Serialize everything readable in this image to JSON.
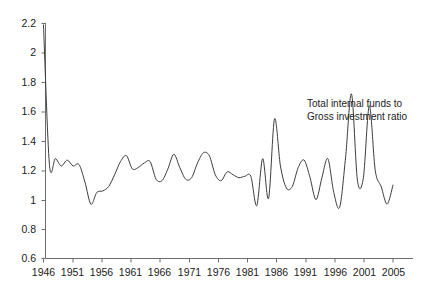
{
  "chart_data": {
    "type": "line",
    "title": "",
    "subtitle": "",
    "xlabel": "",
    "ylabel": "",
    "xlim": [
      1946,
      2005
    ],
    "ylim": [
      0.6,
      2.2
    ],
    "grid": false,
    "legend_position": "inline-annotation",
    "annotations": [
      {
        "name": "series-label",
        "line1": "Total internal funds to",
        "line2": "Gross investment ratio",
        "x": 1988,
        "y": 1.6
      }
    ],
    "y_ticks": [
      "0.6",
      "0.8",
      "1",
      "1.2",
      "1.4",
      "1.6",
      "1.8",
      "2",
      "2.2"
    ],
    "y_tick_values": [
      0.6,
      0.8,
      1.0,
      1.2,
      1.4,
      1.6,
      1.8,
      2.0,
      2.2
    ],
    "x_ticks": [
      "1946",
      "1951",
      "1956",
      "1961",
      "1966",
      "1971",
      "1976",
      "1981",
      "1986",
      "1991",
      "1996",
      "2001",
      "2005"
    ],
    "x_tick_values": [
      1946,
      1951,
      1956,
      1961,
      1966,
      1971,
      1976,
      1981,
      1986,
      1991,
      1996,
      2001,
      2005
    ],
    "series": [
      {
        "name": "Total internal funds to Gross investment ratio",
        "color": "#3c3c3c",
        "x": [
          1946,
          1947,
          1948,
          1949,
          1950,
          1951,
          1952,
          1953,
          1954,
          1955,
          1956,
          1957,
          1958,
          1959,
          1960,
          1961,
          1962,
          1963,
          1964,
          1965,
          1966,
          1967,
          1968,
          1969,
          1970,
          1971,
          1972,
          1973,
          1974,
          1975,
          1976,
          1977,
          1978,
          1979,
          1980,
          1981,
          1982,
          1983,
          1984,
          1985,
          1986,
          1987,
          1988,
          1989,
          1990,
          1991,
          1992,
          1993,
          1994,
          1995,
          1996,
          1997,
          1998,
          1999,
          2000,
          2001,
          2002,
          2003,
          2004,
          2005
        ],
        "values": [
          2.19,
          1.24,
          1.28,
          1.23,
          1.27,
          1.23,
          1.24,
          1.12,
          0.97,
          1.05,
          1.06,
          1.09,
          1.17,
          1.26,
          1.3,
          1.21,
          1.22,
          1.25,
          1.26,
          1.14,
          1.13,
          1.21,
          1.31,
          1.22,
          1.14,
          1.15,
          1.25,
          1.32,
          1.3,
          1.17,
          1.13,
          1.19,
          1.17,
          1.15,
          1.16,
          1.16,
          0.96,
          1.28,
          1.01,
          1.55,
          1.23,
          1.08,
          1.09,
          1.22,
          1.27,
          1.15,
          1.0,
          1.15,
          1.28,
          1.05,
          0.95,
          1.29,
          1.72,
          1.13,
          1.15,
          1.64,
          1.2,
          1.09,
          0.97,
          1.1
        ]
      }
    ]
  }
}
